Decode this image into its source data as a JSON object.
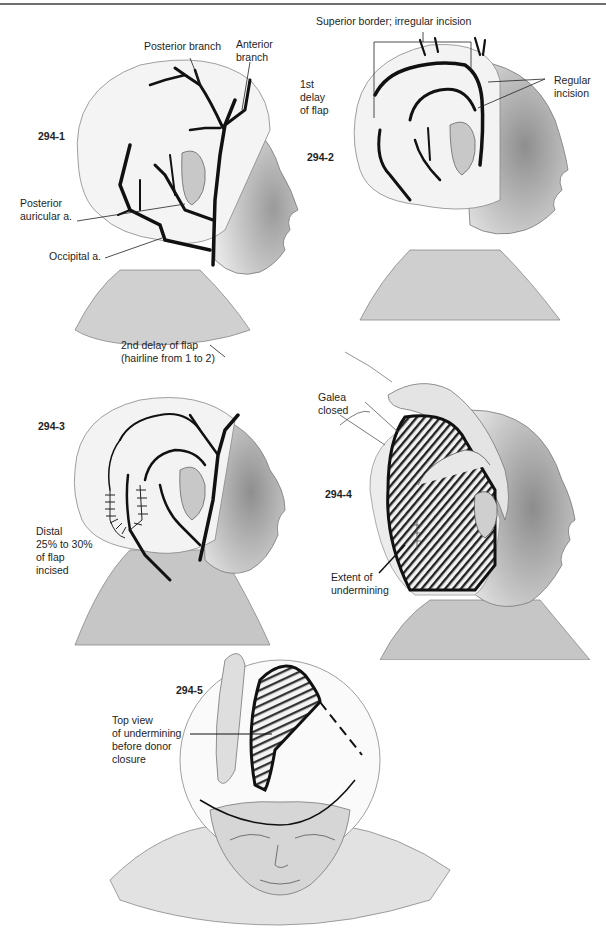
{
  "page": {
    "header_text": "",
    "figure_count": 5
  },
  "figures": [
    {
      "id": "294-1",
      "labels": {
        "posterior_branch": "Posterior branch",
        "anterior_branch_1": "Anterior",
        "anterior_branch_2": "branch",
        "posterior_auricular_1": "Posterior",
        "posterior_auricular_2": "auricular a.",
        "occipital": "Occipital a.",
        "second_delay_1": "2nd delay of flap",
        "second_delay_2": "(hairline from 1 to 2)"
      }
    },
    {
      "id": "294-2",
      "labels": {
        "superior_border": "Superior border; irregular incision",
        "first_delay_1": "1st",
        "first_delay_2": "delay",
        "first_delay_3": "of flap",
        "regular_incision_1": "Regular",
        "regular_incision_2": "incision"
      }
    },
    {
      "id": "294-3",
      "labels": {
        "distal_1": "Distal",
        "distal_2": "25% to 30%",
        "distal_3": "of flap",
        "distal_4": "incised"
      }
    },
    {
      "id": "294-4",
      "labels": {
        "galea_1": "Galea",
        "galea_2": "closed",
        "extent_1": "Extent of",
        "extent_2": "undermining"
      }
    },
    {
      "id": "294-5",
      "labels": {
        "top_view_1": "Top view",
        "top_view_2": "of undermining",
        "top_view_3": "before donor",
        "top_view_4": "closure"
      }
    }
  ],
  "colors": {
    "ink": "#111111",
    "skin_shade": "#bdbdbd",
    "rule": "#6e6e6e"
  }
}
